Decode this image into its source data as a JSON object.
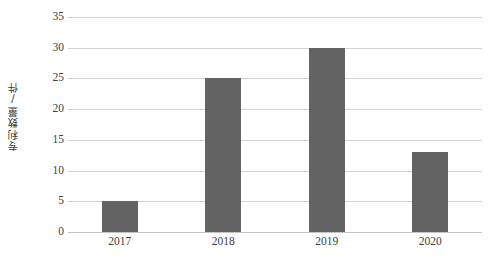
{
  "chart_data": {
    "type": "bar",
    "title": "",
    "subtitle": "",
    "xlabel": "",
    "ylabel": "专利数量/件",
    "categories": [
      "2017",
      "2018",
      "2019",
      "2020"
    ],
    "values": [
      5,
      25,
      30,
      13
    ],
    "series": [
      {
        "name": "专利数量",
        "values": [
          5,
          25,
          30,
          13
        ]
      }
    ],
    "ylim": [
      0,
      35
    ],
    "y_ticks": [
      0,
      5,
      10,
      15,
      20,
      25,
      30,
      35
    ],
    "y_tick_labels": [
      "0",
      "5",
      "10",
      "15",
      "20",
      "25",
      "30",
      "35"
    ],
    "grid": "horizontal",
    "legend": "none",
    "bar_color": "#636363",
    "gridline_color": "#d2d2d2",
    "background_color": "#ffffff",
    "text_color": "#404040"
  }
}
